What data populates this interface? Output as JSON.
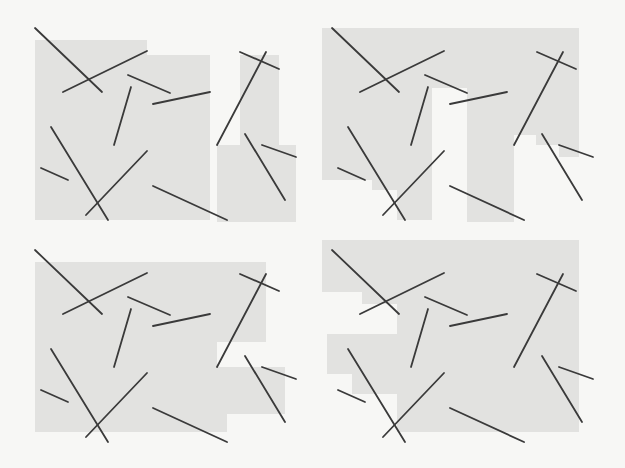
{
  "figure": {
    "colors": {
      "background": "#f7f7f5",
      "region_fill": "#e2e2e0",
      "segment_stroke": "#3a3a3a"
    },
    "segments": [
      [
        35,
        28,
        102,
        92
      ],
      [
        63,
        92,
        147,
        51
      ],
      [
        128,
        75,
        170,
        93
      ],
      [
        131,
        87,
        114,
        145
      ],
      [
        153,
        104,
        210,
        92
      ],
      [
        51,
        127,
        108,
        220
      ],
      [
        86,
        215,
        147,
        151
      ],
      [
        41,
        168,
        68,
        180
      ],
      [
        153,
        186,
        227,
        220
      ],
      [
        240,
        52,
        279,
        69
      ],
      [
        266,
        52,
        217,
        145
      ],
      [
        245,
        134,
        285,
        200
      ],
      [
        262,
        145,
        296,
        157
      ]
    ],
    "panels": [
      {
        "id": "top-left",
        "offset": [
          0,
          0
        ],
        "regions": [
          [
            [
              35,
              40
            ],
            [
              147,
              40
            ],
            [
              147,
              55
            ],
            [
              210,
              55
            ],
            [
              210,
              220
            ],
            [
              35,
              220
            ]
          ],
          [
            [
              240,
              55
            ],
            [
              279,
              55
            ],
            [
              279,
              145
            ],
            [
              296,
              145
            ],
            [
              296,
              222
            ],
            [
              217,
              222
            ],
            [
              217,
              145
            ],
            [
              240,
              145
            ]
          ]
        ]
      },
      {
        "id": "top-right",
        "offset": [
          297,
          0
        ],
        "regions": [
          [
            [
              25,
              28
            ],
            [
              282,
              28
            ],
            [
              282,
              157
            ],
            [
              262,
              157
            ],
            [
              262,
              145
            ],
            [
              239,
              145
            ],
            [
              239,
              135
            ],
            [
              217,
              135
            ],
            [
              217,
              222
            ],
            [
              170,
              222
            ],
            [
              170,
              88
            ],
            [
              135,
              88
            ],
            [
              135,
              220
            ],
            [
              100,
              220
            ],
            [
              100,
              190
            ],
            [
              75,
              190
            ],
            [
              75,
              180
            ],
            [
              25,
              180
            ]
          ],
          [
            [
              170,
              88
            ],
            [
              170,
              222
            ],
            [
              213,
              222
            ],
            [
              213,
              88
            ]
          ]
        ]
      },
      {
        "id": "bottom-left",
        "offset": [
          0,
          222
        ],
        "regions": [
          [
            [
              35,
              40
            ],
            [
              266,
              40
            ],
            [
              266,
              120
            ],
            [
              217,
              120
            ],
            [
              217,
              145
            ],
            [
              285,
              145
            ],
            [
              285,
              192
            ],
            [
              227,
              192
            ],
            [
              227,
              210
            ],
            [
              35,
              210
            ]
          ]
        ]
      },
      {
        "id": "bottom-right",
        "offset": [
          297,
          222
        ],
        "regions": [
          [
            [
              25,
              18
            ],
            [
              282,
              18
            ],
            [
              282,
              210
            ],
            [
              100,
              210
            ],
            [
              100,
              172
            ],
            [
              55,
              172
            ],
            [
              55,
              152
            ],
            [
              30,
              152
            ],
            [
              30,
              112
            ],
            [
              100,
              112
            ],
            [
              100,
              82
            ],
            [
              65,
              82
            ],
            [
              65,
              70
            ],
            [
              25,
              70
            ]
          ]
        ]
      }
    ]
  }
}
